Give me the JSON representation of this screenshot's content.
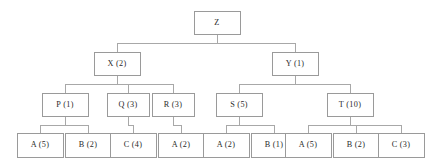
{
  "diagram": {
    "type": "tree",
    "title": "",
    "colors": {
      "background": "#ffffff",
      "box_border": "#9a9a9a",
      "box_fill": "#ffffff",
      "edge": "#a8a8a8",
      "text": "#2a2a2a"
    },
    "levels": [
      {
        "level": 0,
        "nodes": [
          {
            "id": "Z",
            "label": "Z",
            "x": 194,
            "y": 11,
            "w": 46,
            "h": 23
          }
        ]
      },
      {
        "level": 1,
        "nodes": [
          {
            "id": "X",
            "label": "X (2)",
            "x": 94,
            "y": 52,
            "w": 46,
            "h": 23
          },
          {
            "id": "Y",
            "label": "Y (1)",
            "x": 272,
            "y": 52,
            "w": 46,
            "h": 23
          }
        ]
      },
      {
        "level": 2,
        "nodes": [
          {
            "id": "P",
            "label": "P (1)",
            "x": 42,
            "y": 93,
            "w": 46,
            "h": 23
          },
          {
            "id": "Q",
            "label": "Q (3)",
            "x": 107,
            "y": 93,
            "w": 42,
            "h": 23
          },
          {
            "id": "R",
            "label": "R (3)",
            "x": 152,
            "y": 93,
            "w": 42,
            "h": 23
          },
          {
            "id": "S",
            "label": "S (5)",
            "x": 216,
            "y": 93,
            "w": 46,
            "h": 23
          },
          {
            "id": "T",
            "label": "T (10)",
            "x": 327,
            "y": 93,
            "w": 46,
            "h": 23
          }
        ]
      },
      {
        "level": 3,
        "nodes": [
          {
            "id": "L1",
            "label": "A (5)",
            "x": 17,
            "y": 133,
            "w": 46,
            "h": 24
          },
          {
            "id": "L2",
            "label": "B (2)",
            "x": 65,
            "y": 133,
            "w": 46,
            "h": 24
          },
          {
            "id": "L3",
            "label": "C (4)",
            "x": 110,
            "y": 133,
            "w": 46,
            "h": 24
          },
          {
            "id": "L4",
            "label": "A (2)",
            "x": 158,
            "y": 133,
            "w": 46,
            "h": 24
          },
          {
            "id": "L5",
            "label": "A (2)",
            "x": 203,
            "y": 133,
            "w": 46,
            "h": 24
          },
          {
            "id": "L6",
            "label": "B (1)",
            "x": 251,
            "y": 133,
            "w": 46,
            "h": 24
          },
          {
            "id": "L7",
            "label": "A (5)",
            "x": 285,
            "y": 133,
            "w": 46,
            "h": 24
          },
          {
            "id": "L8",
            "label": "B (2)",
            "x": 333,
            "y": 133,
            "w": 46,
            "h": 24
          },
          {
            "id": "L9",
            "label": "C (3)",
            "x": 378,
            "y": 133,
            "w": 46,
            "h": 24
          }
        ]
      }
    ],
    "edges": [
      {
        "from": "Z",
        "to": "X"
      },
      {
        "from": "Z",
        "to": "Y"
      },
      {
        "from": "X",
        "to": "P"
      },
      {
        "from": "X",
        "to": "Q"
      },
      {
        "from": "X",
        "to": "R"
      },
      {
        "from": "Y",
        "to": "S"
      },
      {
        "from": "Y",
        "to": "T"
      },
      {
        "from": "P",
        "to": "L1"
      },
      {
        "from": "P",
        "to": "L2"
      },
      {
        "from": "Q",
        "to": "L3"
      },
      {
        "from": "R",
        "to": "L4"
      },
      {
        "from": "S",
        "to": "L5"
      },
      {
        "from": "S",
        "to": "L6"
      },
      {
        "from": "T",
        "to": "L7"
      },
      {
        "from": "T",
        "to": "L8"
      },
      {
        "from": "T",
        "to": "L9"
      }
    ]
  }
}
